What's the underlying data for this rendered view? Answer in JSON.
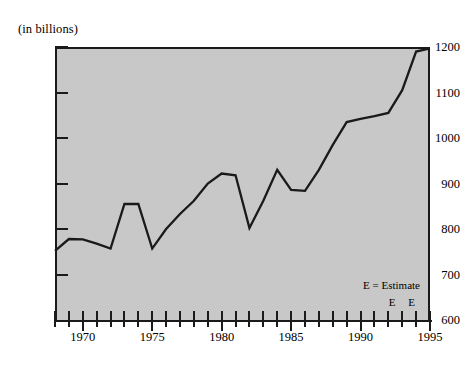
{
  "axis_note": "(in billions)",
  "legend": {
    "estimate_label": "E = Estimate",
    "estimate_markers": "E E"
  },
  "y_ticks": [
    "1200",
    "1100",
    "1000",
    "900",
    "800",
    "700",
    "600"
  ],
  "x_ticks": [
    "1970",
    "1975",
    "1980",
    "1985",
    "1990",
    "1995"
  ],
  "chart_data": {
    "type": "line",
    "title": "",
    "subtitle": "",
    "xlabel": "",
    "ylabel": "(in billions)",
    "xlim": [
      1968,
      1995
    ],
    "ylim": [
      600,
      1200
    ],
    "y_tick_values": [
      600,
      700,
      800,
      900,
      1000,
      1100,
      1200
    ],
    "x_tick_values": [
      1970,
      1975,
      1980,
      1985,
      1990,
      1995
    ],
    "x_minor_tick_interval": 1,
    "grid": false,
    "legend_position": "bottom-right",
    "annotations": [
      "E = Estimate",
      "E E"
    ],
    "estimate_years": [
      1994,
      1995
    ],
    "x": [
      1968,
      1969,
      1970,
      1971,
      1972,
      1973,
      1974,
      1975,
      1976,
      1977,
      1978,
      1979,
      1980,
      1981,
      1982,
      1983,
      1984,
      1985,
      1986,
      1987,
      1988,
      1989,
      1990,
      1991,
      1992,
      1993,
      1994,
      1995
    ],
    "values": [
      752,
      778,
      777,
      768,
      757,
      855,
      855,
      757,
      800,
      833,
      862,
      900,
      922,
      918,
      802,
      862,
      930,
      886,
      884,
      930,
      985,
      1035,
      1042,
      1048,
      1055,
      1105,
      1190,
      1197
    ],
    "series": [
      {
        "name": "value",
        "values": [
          752,
          778,
          777,
          768,
          757,
          855,
          855,
          757,
          800,
          833,
          862,
          900,
          922,
          918,
          802,
          862,
          930,
          886,
          884,
          930,
          985,
          1035,
          1042,
          1048,
          1055,
          1105,
          1190,
          1197
        ]
      }
    ]
  },
  "colors": {
    "plot_background": "#c8c8c8",
    "line": "#1a1a1a",
    "axis": "#1a1a1a",
    "page_background": "#ffffff"
  }
}
